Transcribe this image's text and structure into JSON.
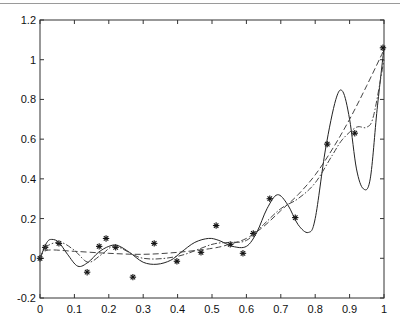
{
  "chart_data": {
    "type": "line",
    "title": "",
    "xlabel": "",
    "ylabel": "",
    "xlim": [
      0,
      1
    ],
    "ylim": [
      -0.2,
      1.2
    ],
    "grid": false,
    "legend": null,
    "x_ticks": [
      "0",
      "0.1",
      "0.2",
      "0.3",
      "0.4",
      "0.5",
      "0.6",
      "0.7",
      "0.8",
      "0.9",
      "1"
    ],
    "y_ticks": [
      "-0.2",
      "0",
      "0.2",
      "0.4",
      "0.6",
      "0.8",
      "1",
      "1.2"
    ],
    "series": [
      {
        "name": "data",
        "style": "markers-asterisk",
        "x": [
          0.0,
          0.015,
          0.055,
          0.137,
          0.172,
          0.192,
          0.22,
          0.27,
          0.332,
          0.398,
          0.468,
          0.512,
          0.553,
          0.59,
          0.62,
          0.668,
          0.742,
          0.835,
          0.915,
          0.997
        ],
        "y": [
          0.0,
          0.055,
          0.075,
          -0.07,
          0.06,
          0.1,
          0.055,
          -0.095,
          0.075,
          -0.015,
          0.03,
          0.165,
          0.07,
          0.025,
          0.125,
          0.3,
          0.205,
          0.575,
          0.63,
          1.06
        ]
      },
      {
        "name": "solid fit (interpolating)",
        "style": "solid",
        "x": [
          0,
          0.02,
          0.035,
          0.055,
          0.08,
          0.11,
          0.14,
          0.17,
          0.2,
          0.225,
          0.26,
          0.3,
          0.34,
          0.38,
          0.41,
          0.45,
          0.49,
          0.52,
          0.56,
          0.6,
          0.63,
          0.66,
          0.69,
          0.72,
          0.75,
          0.78,
          0.8,
          0.83,
          0.86,
          0.88,
          0.9,
          0.92,
          0.94,
          0.96,
          0.98,
          1.0
        ],
        "y": [
          0.0,
          0.08,
          0.095,
          0.08,
          0.02,
          -0.04,
          -0.02,
          0.03,
          0.06,
          0.065,
          0.03,
          -0.02,
          -0.03,
          -0.01,
          0.03,
          0.08,
          0.1,
          0.09,
          0.06,
          0.06,
          0.13,
          0.25,
          0.32,
          0.27,
          0.17,
          0.13,
          0.2,
          0.55,
          0.8,
          0.84,
          0.7,
          0.45,
          0.35,
          0.4,
          0.75,
          1.06
        ]
      },
      {
        "name": "dashed fit (smooth)",
        "style": "dashed",
        "x": [
          0,
          0.02,
          0.1,
          0.2,
          0.3,
          0.4,
          0.5,
          0.55,
          0.6,
          0.65,
          0.7,
          0.75,
          0.8,
          0.85,
          0.9,
          0.95,
          1.0
        ],
        "y": [
          0.0,
          0.04,
          0.035,
          0.025,
          0.02,
          0.03,
          0.05,
          0.07,
          0.1,
          0.16,
          0.24,
          0.32,
          0.42,
          0.55,
          0.7,
          0.87,
          1.05
        ]
      },
      {
        "name": "dash-dot fit",
        "style": "dashdot",
        "x": [
          0,
          0.02,
          0.06,
          0.1,
          0.14,
          0.18,
          0.22,
          0.3,
          0.4,
          0.5,
          0.55,
          0.6,
          0.65,
          0.7,
          0.75,
          0.8,
          0.85,
          0.88,
          0.92,
          0.95,
          0.97,
          1.0
        ],
        "y": [
          0.0,
          0.06,
          0.08,
          0.04,
          -0.02,
          0.02,
          0.06,
          0.0,
          0.01,
          0.07,
          0.08,
          0.09,
          0.17,
          0.25,
          0.3,
          0.38,
          0.52,
          0.6,
          0.66,
          0.66,
          0.72,
          1.0
        ]
      }
    ]
  }
}
